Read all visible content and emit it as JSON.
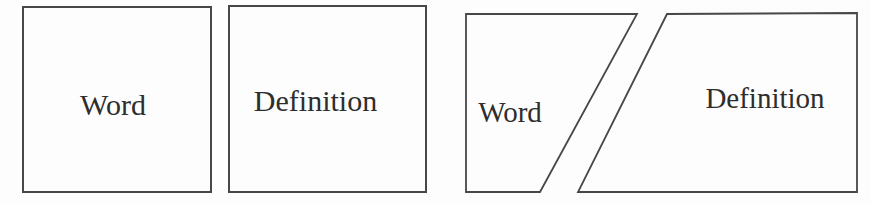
{
  "cards": {
    "word_card": {
      "label": "Word"
    },
    "definition_card": {
      "label": "Definition"
    },
    "split_card": {
      "word_label": "Word",
      "definition_label": "Definition"
    }
  },
  "colors": {
    "background": "#fdfdfd",
    "line": "#474747",
    "text": "#2e2e2e"
  }
}
